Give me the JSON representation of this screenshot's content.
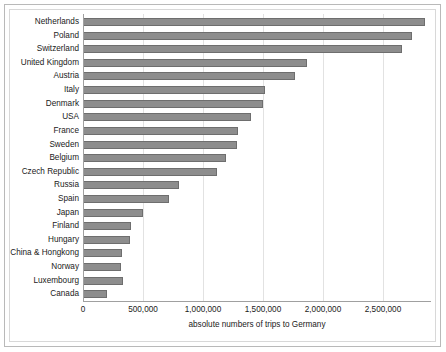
{
  "chart_data": {
    "type": "bar",
    "orientation": "horizontal",
    "title": "",
    "xlabel": "absolute numbers of trips to Germany",
    "ylabel": "",
    "xlim": [
      0,
      2900000
    ],
    "xticks": [
      0,
      500000,
      1000000,
      1500000,
      2000000,
      2500000
    ],
    "xtick_labels": [
      "0",
      "500,000",
      "1,000,000",
      "1,500,000",
      "2,000,000",
      "2,500,000"
    ],
    "grid": true,
    "legend": false,
    "categories": [
      "Netherlands",
      "Poland",
      "Switzerland",
      "United Kingdom",
      "Austria",
      "Italy",
      "Denmark",
      "USA",
      "France",
      "Sweden",
      "Belgium",
      "Czech Republic",
      "Russia",
      "Spain",
      "Japan",
      "Finland",
      "Hungary",
      "China & Hongkong",
      "Norway",
      "Luxembourg",
      "Canada"
    ],
    "values": [
      2850000,
      2740000,
      2660000,
      1870000,
      1770000,
      1520000,
      1500000,
      1400000,
      1290000,
      1280000,
      1190000,
      1120000,
      800000,
      720000,
      500000,
      400000,
      395000,
      325000,
      320000,
      330000,
      200000
    ],
    "bar_color": "#8d8d8d",
    "bar_edge_color": "#6e6e6e"
  }
}
